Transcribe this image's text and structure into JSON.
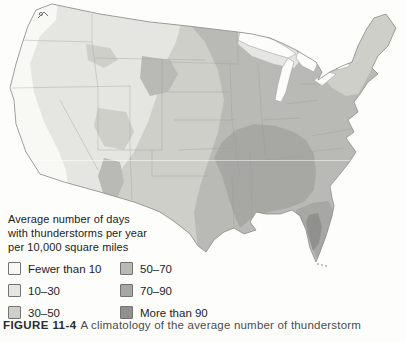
{
  "figure": {
    "label": "FIGURE 11-4",
    "caption_text": "A climatology of the average number of thunderstorm"
  },
  "legend": {
    "title_lines": {
      "line1": "Average number of days",
      "line2": "with thunderstorms per year",
      "line3": "per 10,000 square miles"
    },
    "items": [
      {
        "label": "Fewer than 10",
        "color": "#f8f8f4"
      },
      {
        "label": "10–30",
        "color": "#e5e5e1"
      },
      {
        "label": "30–50",
        "color": "#cfcfca"
      },
      {
        "label": "50–70",
        "color": "#b9b9b5"
      },
      {
        "label": "70–90",
        "color": "#a7a7a4"
      },
      {
        "label": "More than 90",
        "color": "#90908d"
      }
    ]
  },
  "map": {
    "name": "Contiguous United States map shaded by average annual thunderstorm days per 10,000 square miles",
    "colors": {
      "band_fewer_10": "#f8f8f4",
      "band_10_30": "#e5e5e1",
      "band_30_50": "#cfcfca",
      "band_50_70": "#b9b9b5",
      "band_70_90": "#a7a7a4",
      "band_more_90": "#90908d",
      "lake": "#fcfcfa",
      "outline": "#8d8d89",
      "state_line": "#9d9d99"
    }
  }
}
